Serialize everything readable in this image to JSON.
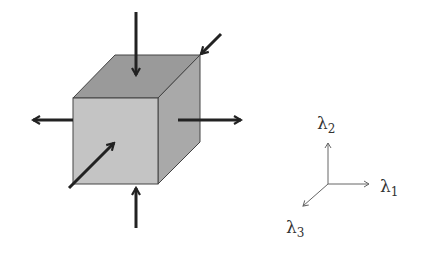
{
  "diagram": {
    "colors": {
      "front_face": "#c4c4c4",
      "top_face": "#9a9a9a",
      "right_face": "#a9a9a9",
      "edge": "#444444",
      "arrow": "#222222",
      "axis": "#666666"
    },
    "axes": {
      "lambda1": {
        "symbol": "λ",
        "subscript": "1"
      },
      "lambda2": {
        "symbol": "λ",
        "subscript": "2"
      },
      "lambda3": {
        "symbol": "λ",
        "subscript": "3"
      }
    },
    "arrows": [
      {
        "id": "top",
        "direction": "inward"
      },
      {
        "id": "bottom",
        "direction": "inward"
      },
      {
        "id": "left",
        "direction": "outward"
      },
      {
        "id": "right",
        "direction": "outward"
      },
      {
        "id": "back-diagonal",
        "direction": "inward"
      },
      {
        "id": "front-diagonal",
        "direction": "inward"
      }
    ]
  }
}
